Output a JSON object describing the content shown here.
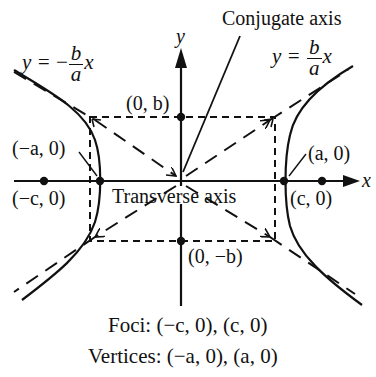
{
  "diagram": {
    "axes": {
      "x_label": "x",
      "y_label": "y"
    },
    "asymptotes": {
      "negative": {
        "lhs": "y =",
        "sign": "−",
        "num": "b",
        "den": "a",
        "var": "x"
      },
      "positive": {
        "lhs": "y =",
        "num": "b",
        "den": "a",
        "var": "x"
      }
    },
    "callouts": {
      "conjugate_axis": "Conjugate axis",
      "transverse_axis": "Transverse axis"
    },
    "points": {
      "neg_vertex": "(−a, 0)",
      "pos_vertex": "(a, 0)",
      "neg_focus": "(−c, 0)",
      "pos_focus": "(c, 0)",
      "co_vertex_top": "(0, b)",
      "co_vertex_bottom": "(0, −b)"
    },
    "summary": {
      "foci": "Foci:  (−c, 0), (c, 0)",
      "vertices": "Vertices:  (−a, 0), (a, 0)"
    },
    "colors": {
      "ink": "#111111",
      "background": "#ffffff"
    }
  }
}
